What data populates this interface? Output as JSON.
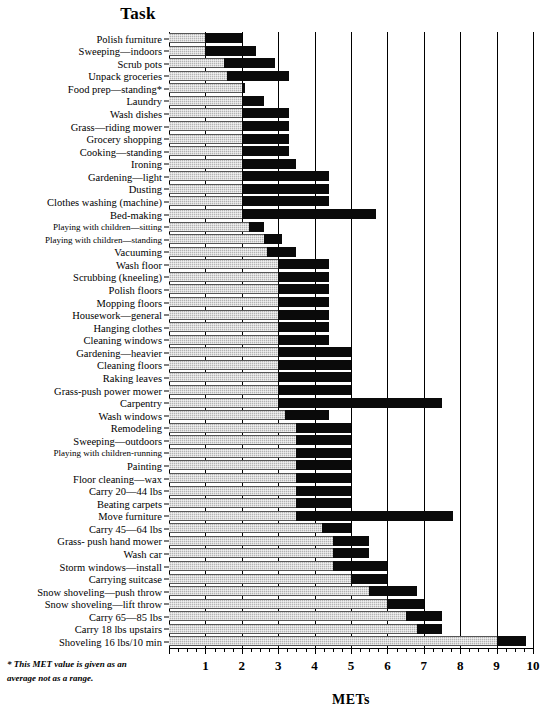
{
  "chart_data": {
    "type": "bar",
    "title": "Task",
    "xlabel": "METs",
    "ylabel": "Task",
    "xlim": [
      0,
      10
    ],
    "xticks": [
      1,
      2,
      3,
      4,
      5,
      6,
      7,
      8,
      9,
      10
    ],
    "xticklabels": [
      "1",
      "2",
      "3",
      "4",
      "5",
      "6",
      "7",
      "8",
      "9",
      "10"
    ],
    "grid": true,
    "orientation": "horizontal",
    "note": "Each task is shown as a range: the light (stippled grey) segment spans from 0 to the low MET value, the black segment spans from the low to the high MET value.",
    "series": [
      {
        "name": "low MET",
        "color": "#b4b4b4"
      },
      {
        "name": "high MET",
        "color": "#0a0a0a"
      }
    ],
    "categories": [
      "Polish furniture",
      "Sweeping—indoors",
      "Scrub pots",
      "Unpack groceries",
      "Food prep—standing*",
      "Laundry",
      "Wash dishes",
      "Grass—riding mower",
      "Grocery shopping",
      "Cooking—standing",
      "Ironing",
      "Gardening—light",
      "Dusting",
      "Clothes washing (machine)",
      "Bed-making",
      "Playing with children—sitting",
      "Playing with children—standing",
      "Vacuuming",
      "Wash floor",
      "Scrubbing (kneeling)",
      "Polish floors",
      "Mopping floors",
      "Housework—general",
      "Hanging clothes",
      "Cleaning windows",
      "Gardening—heavier",
      "Cleaning floors",
      "Raking leaves",
      "Grass-push power mower",
      "Carpentry",
      "Wash windows",
      "Remodeling",
      "Sweeping—outdoors",
      "Playing with children-running",
      "Painting",
      "Floor cleaning—wax",
      "Carry 20—44 lbs",
      "Beating carpets",
      "Move furniture",
      "Carry 45—64 lbs",
      "Grass- push hand mower",
      "Wash car",
      "Storm windows—install",
      "Carrying suitcase",
      "Snow shoveling—push throw",
      "Snow shoveling—lift throw",
      "Carry 65—85 lbs",
      "Carry 18 lbs upstairs",
      "Shoveling 16 lbs/10 min"
    ],
    "low": [
      1.0,
      1.0,
      1.5,
      1.6,
      2.0,
      2.0,
      2.0,
      2.0,
      2.0,
      2.0,
      2.0,
      2.0,
      2.0,
      2.0,
      2.0,
      2.2,
      2.6,
      2.7,
      3.0,
      3.0,
      3.0,
      3.0,
      3.0,
      3.0,
      3.0,
      3.0,
      3.0,
      3.0,
      3.0,
      3.0,
      3.2,
      3.5,
      3.5,
      3.5,
      3.5,
      3.5,
      3.5,
      3.5,
      3.5,
      4.2,
      4.5,
      4.5,
      4.5,
      5.0,
      5.5,
      6.0,
      6.5,
      6.8,
      9.0
    ],
    "high": [
      2.0,
      2.4,
      2.9,
      3.3,
      2.1,
      2.6,
      3.3,
      3.3,
      3.3,
      3.3,
      3.5,
      4.4,
      4.4,
      4.4,
      5.7,
      2.6,
      3.1,
      3.5,
      4.4,
      4.4,
      4.4,
      4.4,
      4.4,
      4.4,
      4.4,
      5.0,
      5.0,
      5.0,
      5.0,
      7.5,
      4.4,
      5.0,
      5.0,
      5.0,
      5.0,
      5.0,
      5.0,
      5.0,
      7.8,
      5.0,
      5.5,
      5.5,
      6.0,
      6.0,
      6.8,
      7.0,
      7.5,
      7.5,
      9.8
    ]
  },
  "axis": {
    "title": "METs",
    "y_header": "Task",
    "tick_labels": [
      "1",
      "2",
      "3",
      "4",
      "5",
      "6",
      "7",
      "8",
      "9",
      "10"
    ]
  },
  "footnote": {
    "line1": "* This MET value is given as an",
    "line2": "average not as a range."
  }
}
